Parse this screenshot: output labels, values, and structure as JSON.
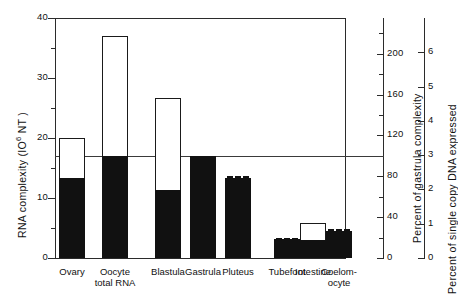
{
  "figure": {
    "background": "#ffffff",
    "ink": "#111111"
  },
  "axes": {
    "left": {
      "title_prefix": "RNA  complexity  (IO",
      "title_exponent": "6",
      "title_suffix": " NT )",
      "title_full": "RNA complexity (10⁶ NT)",
      "ticks_major": [
        "0",
        "10",
        "20",
        "30",
        "40"
      ],
      "tick_values": [
        0,
        10,
        20,
        30,
        40
      ],
      "minor_tick_values": [
        5,
        15,
        25,
        35
      ],
      "min": 0,
      "max": 40
    },
    "right_inner": {
      "title": "Percent of gastrula complexity",
      "ticks_major": [
        "0",
        "40",
        "80",
        "120",
        "160",
        "200"
      ],
      "tick_values": [
        0,
        40,
        80,
        120,
        160,
        200
      ],
      "minor_tick_values": [
        20,
        60,
        100,
        140,
        180,
        220
      ],
      "min": 0,
      "max": 235
    },
    "right_outer": {
      "title": "Percent of single copy DNA expressed",
      "ticks_major": [
        "0",
        "1",
        "2",
        "3",
        "4",
        "5",
        "6"
      ],
      "tick_values": [
        0,
        1,
        2,
        3,
        4,
        5,
        6
      ],
      "min": 0,
      "max": 7
    }
  },
  "reference_line": {
    "name": "gastrula-complexity-line",
    "value": 17.0,
    "color": "#3a3a3a"
  },
  "chart_data": {
    "type": "bar",
    "title": "",
    "subtitle": "",
    "xlabel": "",
    "ylabel": "RNA complexity (10⁶ NT)",
    "ylim": [
      0,
      40
    ],
    "grid": false,
    "legend": "none",
    "y2label": "Percent of gastrula complexity",
    "y2lim": [
      0,
      235
    ],
    "y3label": "Percent of single copy DNA expressed",
    "y3lim": [
      0,
      7
    ],
    "categories": [
      "Ovary",
      "Oocyte total RNA",
      "Blastula",
      "Gastrula",
      "Pluteus",
      "Tubefoot",
      "Intestine",
      "Coelomocyte"
    ],
    "series": [
      {
        "name": "Total RNA complexity (outline)",
        "values": [
          20.0,
          37.0,
          26.7,
          17.0,
          13.7,
          3.3,
          5.8,
          4.8
        ]
      },
      {
        "name": "Filled (solid black) complexity",
        "values": [
          13.3,
          17.0,
          11.3,
          17.0,
          13.3,
          3.2,
          3.0,
          4.5
        ]
      }
    ],
    "annotations": [
      {
        "type": "hline",
        "value": 17.0,
        "label": "gastrula complexity reference"
      },
      {
        "type": "dashed-cap",
        "category": "Pluteus"
      },
      {
        "type": "dashed-cap",
        "category": "Tubefoot"
      },
      {
        "type": "dashed-cap",
        "category": "Coelomocyte"
      }
    ]
  },
  "bars": [
    {
      "name": "ovary",
      "label": "Ovary",
      "label_line2": "",
      "total": 20.0,
      "filled": 13.3,
      "outline": true,
      "dashed_cap": false
    },
    {
      "name": "oocyte",
      "label": "Oocyte",
      "label_line2": "total RNA",
      "total": 37.0,
      "filled": 17.0,
      "outline": true,
      "dashed_cap": false
    },
    {
      "name": "blastula",
      "label": "Blastula",
      "label_line2": "",
      "total": 26.7,
      "filled": 11.3,
      "outline": true,
      "dashed_cap": false
    },
    {
      "name": "gastrula",
      "label": "Gastrula",
      "label_line2": "",
      "total": 17.0,
      "filled": 17.0,
      "outline": false,
      "dashed_cap": false
    },
    {
      "name": "pluteus",
      "label": "Pluteus",
      "label_line2": "",
      "total": 13.7,
      "filled": 13.3,
      "outline": false,
      "dashed_cap": true
    },
    {
      "name": "tubefoot",
      "label": "Tubefoot",
      "label_line2": "",
      "total": 3.4,
      "filled": 3.2,
      "outline": false,
      "dashed_cap": true
    },
    {
      "name": "intestine",
      "label": "Intestine",
      "label_line2": "",
      "total": 5.8,
      "filled": 3.0,
      "outline": true,
      "dashed_cap": false
    },
    {
      "name": "coelomocyte",
      "label": "Coelom-",
      "label_line2": "ocyte",
      "total": 4.9,
      "filled": 4.5,
      "outline": false,
      "dashed_cap": true
    }
  ]
}
